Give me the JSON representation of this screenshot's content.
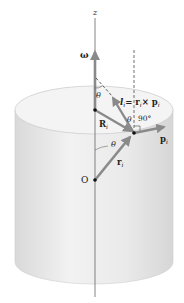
{
  "diagram": {
    "labels": {
      "z_axis": "z",
      "omega": "ω",
      "theta_top": "θ",
      "l_i_symbol": "l",
      "l_i_sub": "i",
      "l_i_eq": "= r",
      "l_i_eq_sub": "i",
      "l_i_cross": "× p",
      "l_i_cross_sub": "i",
      "theta_mid": "θ",
      "right_angle": "90°",
      "R_i": "R",
      "R_i_sub": "i",
      "p_i": "p",
      "p_i_sub": "i",
      "theta_bottom": "θ",
      "r_i": "r",
      "r_i_sub": "i",
      "origin": "O"
    },
    "colors": {
      "cylinder_fill": "#ececec",
      "cylinder_top": "#f3f3f3",
      "vector": "#8a8a8a",
      "axis": "#666666",
      "text": "#222222"
    }
  }
}
